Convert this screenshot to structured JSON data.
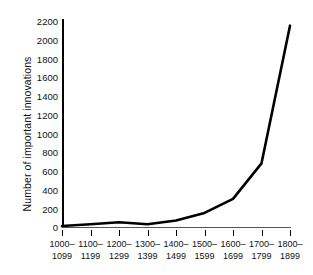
{
  "chart_data": {
    "type": "line",
    "title": "",
    "xlabel": "",
    "ylabel": "Number of important innovations",
    "categories": [
      "1000–\n1099",
      "1100–\n1199",
      "1200–\n1299",
      "1300–\n1399",
      "1400–\n1499",
      "1500–\n1599",
      "1600–\n1699",
      "1700–\n1799",
      "1800–\n1899"
    ],
    "values": [
      10,
      30,
      50,
      30,
      70,
      150,
      300,
      680,
      2150
    ],
    "x": [
      1000,
      1100,
      1200,
      1300,
      1400,
      1500,
      1600,
      1700,
      1800
    ],
    "ylim": [
      0,
      2200
    ],
    "yticks": [
      0,
      200,
      400,
      600,
      800,
      1000,
      1200,
      1400,
      1600,
      1800,
      2000,
      2200
    ],
    "ytick_labels": [
      "0",
      "200",
      "400",
      "600",
      "800",
      "1000",
      "1200",
      "1400",
      "1600",
      "1800",
      "2000",
      "2200"
    ],
    "grid": false,
    "legend": "none",
    "line_color": "#000000",
    "background_color": "#ffffff",
    "markers": false
  },
  "axis": {
    "y_title": "Number of important innovations"
  }
}
